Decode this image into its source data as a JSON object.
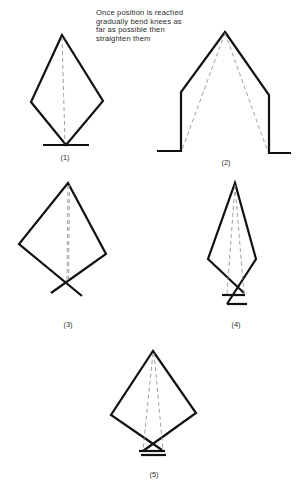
{
  "caption": {
    "lines": [
      "Once position is reached",
      "gradually bend knees as",
      "far as possible then",
      "straighten them"
    ]
  },
  "figures": [
    {
      "id": 1,
      "label": "(1)",
      "label_pos": [
        65,
        153
      ]
    },
    {
      "id": 2,
      "label": "(2)",
      "label_pos": [
        226,
        158
      ]
    },
    {
      "id": 3,
      "label": "(3)",
      "label_pos": [
        68,
        320
      ]
    },
    {
      "id": 4,
      "label": "(4)",
      "label_pos": [
        236,
        320
      ]
    },
    {
      "id": 5,
      "label": "(5)",
      "label_pos": [
        154,
        470
      ]
    }
  ],
  "colors": {
    "line": "#111111",
    "dashed": "#888888",
    "text": "#2a2a2a",
    "background": "#ffffff"
  }
}
